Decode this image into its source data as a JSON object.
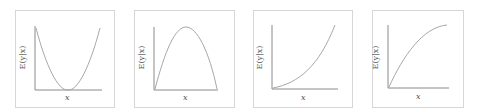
{
  "panels": [
    {
      "id": "quadratic-convex",
      "shape": "U-shaped (minimum in middle)",
      "ylabel": "E(y|x)",
      "xlabel": "x"
    },
    {
      "id": "quadratic-concave",
      "shape": "inverted U (maximum in middle)",
      "ylabel": "E(y|x)",
      "xlabel": "x"
    },
    {
      "id": "increasing-convex",
      "shape": "increasing at increasing rate",
      "ylabel": "E(y|x)",
      "xlabel": "x"
    },
    {
      "id": "increasing-concave",
      "shape": "increasing at decreasing rate",
      "ylabel": "E(y|x)",
      "xlabel": "x"
    }
  ],
  "colors": {
    "curve": "#a8a8a8",
    "axis": "#8a8a8a",
    "border": "#d6d6d6",
    "text": "#555555"
  }
}
